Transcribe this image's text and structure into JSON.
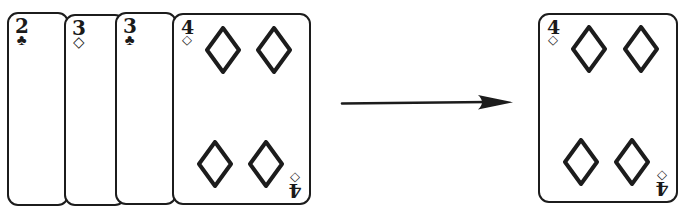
{
  "scene": {
    "title": "Playing card stack with extraction arrow",
    "background_color": "#ffffff",
    "ink_color": "#1c1c1c",
    "width": 689,
    "height": 215
  },
  "stack": {
    "name": "fanned-card-stack",
    "cards": [
      {
        "id": "card-2-clubs",
        "rank": "2",
        "suit_symbol": "♣",
        "suit_name": "clubs",
        "label": "2 of clubs",
        "x": 7,
        "y": 12,
        "width": 62,
        "height": 194,
        "has_pips": false
      },
      {
        "id": "card-3-diamonds",
        "rank": "3",
        "suit_symbol": "◇",
        "suit_name": "diamonds",
        "label": "3 of diamonds",
        "x": 64,
        "y": 14,
        "width": 62,
        "height": 192,
        "has_pips": false
      },
      {
        "id": "card-3-clubs",
        "rank": "3",
        "suit_symbol": "♣",
        "suit_name": "clubs",
        "label": "3 of clubs",
        "x": 115,
        "y": 12,
        "width": 62,
        "height": 193,
        "has_pips": false
      },
      {
        "id": "card-4-diamonds-stacked",
        "rank": "4",
        "suit_symbol": "◇",
        "suit_name": "diamonds",
        "label": "4 of diamonds",
        "x": 172,
        "y": 13,
        "width": 139,
        "height": 192,
        "has_pips": true,
        "pip_count": 4
      }
    ]
  },
  "arrow": {
    "name": "transform-arrow",
    "direction": "right",
    "x1": 342,
    "y1": 102,
    "x2": 512,
    "y2": 102
  },
  "result": {
    "card": {
      "id": "card-4-diamonds-result",
      "rank": "4",
      "suit_symbol": "◇",
      "suit_name": "diamonds",
      "label": "4 of diamonds",
      "x": 538,
      "y": 13,
      "width": 140,
      "height": 190,
      "has_pips": true,
      "pip_count": 4
    }
  }
}
